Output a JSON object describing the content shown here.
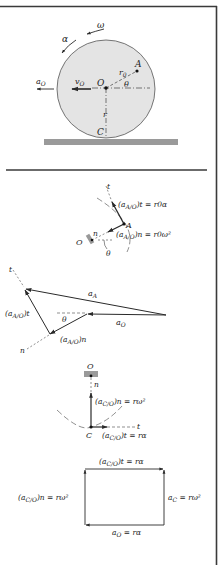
{
  "figure": {
    "frame_color": "#3a3a3a",
    "disk_fill": "#e4e4e4",
    "ground_fill": "#9a9a9a",
    "line_color": "#2a2a2a"
  },
  "panel_disk": {
    "labels": {
      "omega": "ω",
      "alpha": "α",
      "aO": "a",
      "aO_sub": "O",
      "vO": "v",
      "vO_sub": "O",
      "O": "O",
      "A": "A",
      "r0": "r",
      "r0_sub": "0",
      "theta": "θ",
      "r": "r",
      "C": "C"
    }
  },
  "panel_A_components": {
    "labels": {
      "t": "t",
      "n": "n",
      "A": "A",
      "O": "O",
      "theta": "θ",
      "at_eq": "(a",
      "at_sub": "A/O",
      "at_rhs": ")t = r0α",
      "an_eq": "(a",
      "an_sub": "A/O",
      "an_rhs": ")n = r0ω²"
    }
  },
  "panel_vector_polygon": {
    "labels": {
      "t": "t",
      "n": "n",
      "aA": "a",
      "aA_sub": "A",
      "aO": "a",
      "aO_sub": "O",
      "theta": "θ",
      "aAO_t": "(a",
      "aAO_t_sub": "A/O",
      "aAO_t_end": ")t",
      "aAO_n": "(a",
      "aAO_n_sub": "A/O",
      "aAO_n_end": ")n"
    }
  },
  "panel_C_components": {
    "labels": {
      "O": "O",
      "n": "n",
      "t": "t",
      "C": "C",
      "cn_eq": "(a",
      "cn_sub": "C/O",
      "cn_rhs": ")n = rω²",
      "ct_eq": "(a",
      "ct_sub": "C/O",
      "ct_rhs": ")t = rα"
    }
  },
  "panel_C_rectangle": {
    "labels": {
      "top": "(a",
      "top_sub": "C/O",
      "top_rhs": ")t = rα",
      "left": "(a",
      "left_sub": "C/O",
      "left_rhs": ")n = rω²",
      "right": "a",
      "right_sub": "C",
      "right_rhs": " = rω²",
      "bottom": "a",
      "bottom_sub": "O",
      "bottom_rhs": " = rα"
    }
  }
}
